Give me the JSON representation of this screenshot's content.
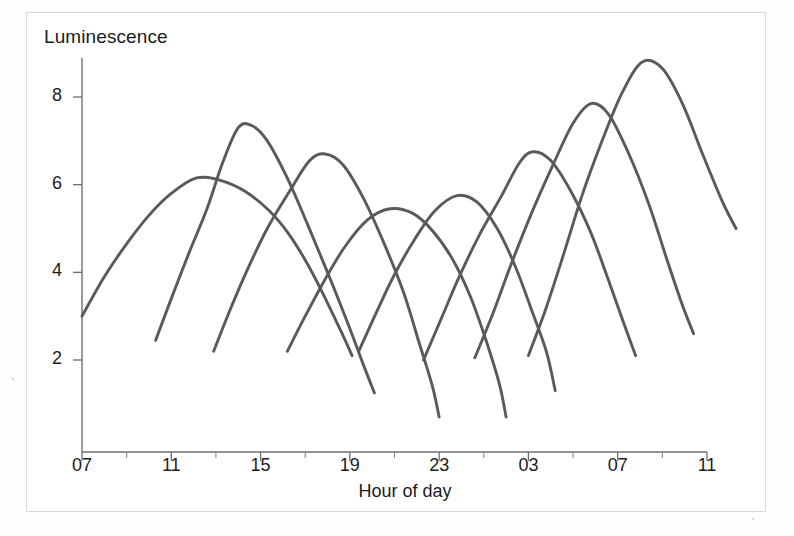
{
  "chart_data": {
    "type": "line",
    "title": "",
    "xlabel": "Hour of day",
    "ylabel": "Luminescence",
    "xlim": [
      7,
      35
    ],
    "ylim": [
      0.3,
      9.6
    ],
    "grid": false,
    "legend": null,
    "x_tick_labels": [
      "07",
      "11",
      "15",
      "19",
      "23",
      "03",
      "07",
      "11"
    ],
    "x_tick_values": [
      7,
      11,
      15,
      19,
      23,
      27,
      31,
      35
    ],
    "x_minor_tick_values": [
      9,
      13,
      17,
      21,
      25,
      29,
      33
    ],
    "y_tick_labels": [
      "2",
      "4",
      "6",
      "8"
    ],
    "y_tick_values": [
      2,
      4,
      6,
      8
    ],
    "series": [
      {
        "name": "cycle-1",
        "peak_hour": 12.1,
        "peak_value": 6.15,
        "points": [
          {
            "x": 7.0,
            "y": 3.0
          },
          {
            "x": 8.0,
            "y": 3.9
          },
          {
            "x": 9.0,
            "y": 4.65
          },
          {
            "x": 10.0,
            "y": 5.3
          },
          {
            "x": 11.0,
            "y": 5.8
          },
          {
            "x": 12.1,
            "y": 6.15
          },
          {
            "x": 13.2,
            "y": 6.1
          },
          {
            "x": 14.3,
            "y": 5.85
          },
          {
            "x": 15.4,
            "y": 5.4
          },
          {
            "x": 16.3,
            "y": 4.85
          },
          {
            "x": 17.2,
            "y": 4.1
          },
          {
            "x": 18.0,
            "y": 3.3
          },
          {
            "x": 18.7,
            "y": 2.55
          },
          {
            "x": 19.1,
            "y": 2.1
          }
        ]
      },
      {
        "name": "cycle-2",
        "peak_hour": 14.0,
        "peak_value": 7.35,
        "points": [
          {
            "x": 10.3,
            "y": 2.45
          },
          {
            "x": 11.0,
            "y": 3.4
          },
          {
            "x": 11.8,
            "y": 4.45
          },
          {
            "x": 12.6,
            "y": 5.45
          },
          {
            "x": 13.3,
            "y": 6.5
          },
          {
            "x": 14.0,
            "y": 7.3
          },
          {
            "x": 14.6,
            "y": 7.35
          },
          {
            "x": 15.3,
            "y": 7.0
          },
          {
            "x": 16.2,
            "y": 6.15
          },
          {
            "x": 17.1,
            "y": 5.1
          },
          {
            "x": 18.0,
            "y": 4.0
          },
          {
            "x": 18.9,
            "y": 2.85
          },
          {
            "x": 19.6,
            "y": 1.9
          },
          {
            "x": 20.1,
            "y": 1.25
          }
        ]
      },
      {
        "name": "cycle-3",
        "peak_hour": 17.7,
        "peak_value": 6.7,
        "points": [
          {
            "x": 12.9,
            "y": 2.2
          },
          {
            "x": 13.6,
            "y": 3.1
          },
          {
            "x": 14.4,
            "y": 4.05
          },
          {
            "x": 15.3,
            "y": 5.0
          },
          {
            "x": 16.3,
            "y": 5.85
          },
          {
            "x": 17.2,
            "y": 6.55
          },
          {
            "x": 17.9,
            "y": 6.7
          },
          {
            "x": 18.7,
            "y": 6.45
          },
          {
            "x": 19.6,
            "y": 5.7
          },
          {
            "x": 20.5,
            "y": 4.7
          },
          {
            "x": 21.4,
            "y": 3.55
          },
          {
            "x": 22.1,
            "y": 2.4
          },
          {
            "x": 22.7,
            "y": 1.4
          },
          {
            "x": 23.0,
            "y": 0.7
          }
        ]
      },
      {
        "name": "cycle-4",
        "peak_hour": 21.0,
        "peak_value": 5.45,
        "points": [
          {
            "x": 16.2,
            "y": 2.2
          },
          {
            "x": 17.0,
            "y": 3.0
          },
          {
            "x": 17.9,
            "y": 3.85
          },
          {
            "x": 18.8,
            "y": 4.6
          },
          {
            "x": 19.8,
            "y": 5.2
          },
          {
            "x": 20.8,
            "y": 5.45
          },
          {
            "x": 21.8,
            "y": 5.35
          },
          {
            "x": 22.7,
            "y": 4.95
          },
          {
            "x": 23.6,
            "y": 4.3
          },
          {
            "x": 24.4,
            "y": 3.45
          },
          {
            "x": 25.1,
            "y": 2.45
          },
          {
            "x": 25.7,
            "y": 1.45
          },
          {
            "x": 26.0,
            "y": 0.7
          }
        ]
      },
      {
        "name": "cycle-5",
        "peak_hour": 23.8,
        "peak_value": 5.75,
        "points": [
          {
            "x": 19.4,
            "y": 2.2
          },
          {
            "x": 20.2,
            "y": 3.1
          },
          {
            "x": 21.0,
            "y": 3.95
          },
          {
            "x": 21.9,
            "y": 4.75
          },
          {
            "x": 22.8,
            "y": 5.4
          },
          {
            "x": 23.8,
            "y": 5.75
          },
          {
            "x": 24.7,
            "y": 5.6
          },
          {
            "x": 25.6,
            "y": 5.0
          },
          {
            "x": 26.4,
            "y": 4.15
          },
          {
            "x": 27.1,
            "y": 3.2
          },
          {
            "x": 27.8,
            "y": 2.2
          },
          {
            "x": 28.2,
            "y": 1.3
          }
        ]
      },
      {
        "name": "cycle-6",
        "peak_hour": 27.0,
        "peak_value": 6.75,
        "points": [
          {
            "x": 22.3,
            "y": 2.0
          },
          {
            "x": 23.1,
            "y": 2.95
          },
          {
            "x": 23.9,
            "y": 3.9
          },
          {
            "x": 24.8,
            "y": 4.85
          },
          {
            "x": 25.8,
            "y": 5.75
          },
          {
            "x": 26.6,
            "y": 6.5
          },
          {
            "x": 27.2,
            "y": 6.75
          },
          {
            "x": 28.0,
            "y": 6.55
          },
          {
            "x": 28.9,
            "y": 5.85
          },
          {
            "x": 29.8,
            "y": 4.9
          },
          {
            "x": 30.6,
            "y": 3.8
          },
          {
            "x": 31.3,
            "y": 2.8
          },
          {
            "x": 31.8,
            "y": 2.1
          }
        ]
      },
      {
        "name": "cycle-7",
        "peak_hour": 29.8,
        "peak_value": 7.85,
        "points": [
          {
            "x": 24.6,
            "y": 2.05
          },
          {
            "x": 25.4,
            "y": 3.05
          },
          {
            "x": 26.2,
            "y": 4.15
          },
          {
            "x": 27.1,
            "y": 5.3
          },
          {
            "x": 28.1,
            "y": 6.45
          },
          {
            "x": 29.0,
            "y": 7.4
          },
          {
            "x": 29.8,
            "y": 7.85
          },
          {
            "x": 30.6,
            "y": 7.6
          },
          {
            "x": 31.5,
            "y": 6.7
          },
          {
            "x": 32.4,
            "y": 5.55
          },
          {
            "x": 33.2,
            "y": 4.3
          },
          {
            "x": 33.9,
            "y": 3.25
          },
          {
            "x": 34.4,
            "y": 2.6
          }
        ]
      },
      {
        "name": "cycle-8",
        "peak_hour": 32.1,
        "peak_value": 8.8,
        "points": [
          {
            "x": 27.0,
            "y": 2.1
          },
          {
            "x": 27.8,
            "y": 3.2
          },
          {
            "x": 28.6,
            "y": 4.45
          },
          {
            "x": 29.4,
            "y": 5.75
          },
          {
            "x": 30.3,
            "y": 7.0
          },
          {
            "x": 31.2,
            "y": 8.1
          },
          {
            "x": 32.1,
            "y": 8.8
          },
          {
            "x": 33.0,
            "y": 8.65
          },
          {
            "x": 33.9,
            "y": 7.85
          },
          {
            "x": 34.8,
            "y": 6.7
          },
          {
            "x": 35.7,
            "y": 5.6
          },
          {
            "x": 36.3,
            "y": 5.0
          }
        ]
      }
    ]
  }
}
